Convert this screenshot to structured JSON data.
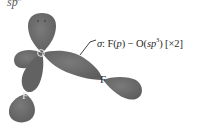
{
  "diagram": {
    "hybridization_label": {
      "base": "sp",
      "superscript": "3"
    },
    "atoms": {
      "central": "O",
      "fluorine_left": "F",
      "fluorine_right": "F"
    },
    "annotation": {
      "sigma": "σ",
      "colon": ":",
      "part1_letter": " F(",
      "part1_orbital": "p",
      "part1_close": ") − O(",
      "part2_orbital": "sp",
      "part2_sup": "3",
      "part2_close": ") [×2]"
    },
    "colors": {
      "lobe_fill": "#6e6e6e",
      "lobe_dark": "#5c5c5c",
      "background": "#ffffff",
      "text": "#2a2a2a"
    }
  }
}
